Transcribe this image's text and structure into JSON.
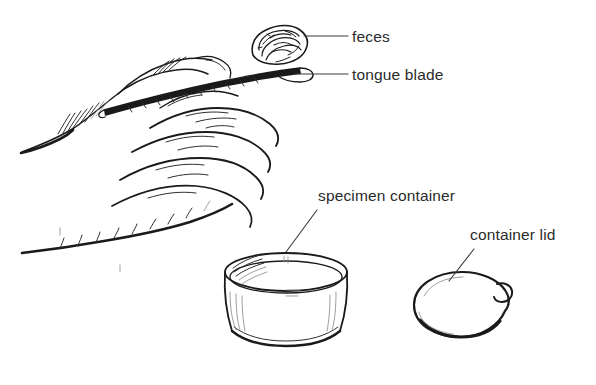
{
  "figure": {
    "background_color": "#ffffff",
    "ink_color": "#1a1a1a",
    "label_color": "#2b2b2b",
    "width": 596,
    "height": 385
  },
  "labels": [
    {
      "id": "feces",
      "text": "feces",
      "x": 352,
      "y": 42,
      "leader": {
        "type": "horizontal",
        "x1": 304,
        "y1": 36,
        "x2": 348,
        "y2": 36
      }
    },
    {
      "id": "tongue-blade",
      "text": "tongue blade",
      "x": 352,
      "y": 80,
      "leader": {
        "type": "horizontal",
        "x1": 296,
        "y1": 74,
        "x2": 348,
        "y2": 74
      }
    },
    {
      "id": "specimen-container",
      "text": "specimen container",
      "x": 318,
      "y": 201,
      "leader": {
        "type": "diagonal",
        "x1": 286,
        "y1": 250,
        "x2": 318,
        "y2": 210
      }
    },
    {
      "id": "container-lid",
      "text": "container lid",
      "x": 470,
      "y": 240,
      "leader": {
        "type": "diagonal",
        "x1": 449,
        "y1": 279,
        "x2": 474,
        "y2": 249
      }
    }
  ],
  "objects": [
    {
      "id": "hand",
      "name": "hand",
      "description": "left hand, line drawing, fingers curled, holding tongue blade"
    },
    {
      "id": "tongue-blade",
      "name": "tongue blade",
      "description": "thin flat wooden blade held between thumb and index finger"
    },
    {
      "id": "feces",
      "name": "feces",
      "description": "small scribbled specimen mass resting on the blade tip"
    },
    {
      "id": "specimen-container",
      "name": "specimen container",
      "description": "tapered open plastic cup with rim"
    },
    {
      "id": "container-lid",
      "name": "container lid",
      "description": "oval snap-on lid with small side tab"
    }
  ]
}
